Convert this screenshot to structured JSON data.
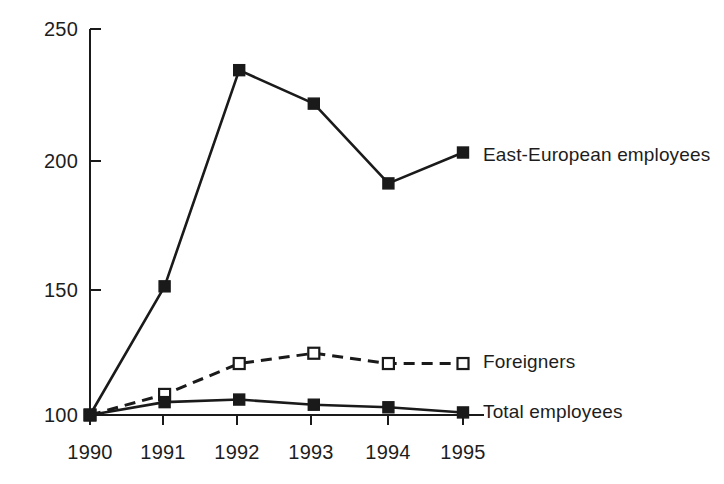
{
  "chart_data": {
    "type": "line",
    "title": "",
    "subtitle": "",
    "xlabel": "",
    "ylabel": "",
    "categories": [
      "1990",
      "1991",
      "1992",
      "1993",
      "1994",
      "1995"
    ],
    "x": [
      1990,
      1991,
      1992,
      1993,
      1994,
      1995
    ],
    "ylim": [
      100,
      250
    ],
    "yticks": [
      "100",
      "150",
      "200",
      "250"
    ],
    "ytick_values": [
      100,
      150,
      200,
      250
    ],
    "grid": false,
    "legend_position": "inline-right-of-series-end",
    "series": [
      {
        "name": "East-European employees",
        "values": [
          100,
          150,
          234,
          221,
          190,
          202
        ],
        "marker": "filled-square",
        "line_style": "solid",
        "color": "#1a1a1a"
      },
      {
        "name": "Foreigners",
        "values": [
          100,
          108,
          120,
          124,
          120,
          120
        ],
        "marker": "open-square",
        "line_style": "dashed",
        "color": "#1a1a1a"
      },
      {
        "name": "Total employees",
        "values": [
          100,
          105,
          106,
          104,
          103,
          101
        ],
        "marker": "filled-square",
        "line_style": "solid",
        "color": "#1a1a1a"
      }
    ],
    "annotations": [
      {
        "text": "East-European employees",
        "at_series": "East-European employees",
        "at_x": "1995"
      },
      {
        "text": "Foreigners",
        "at_series": "Foreigners",
        "at_x": "1995"
      },
      {
        "text": "Total employees",
        "at_series": "Total employees",
        "at_x": "1995"
      }
    ]
  },
  "axis": {
    "y_ticks": [
      {
        "label": "250"
      },
      {
        "label": "200"
      },
      {
        "label": "150"
      },
      {
        "label": "100"
      }
    ],
    "x_ticks": [
      {
        "label": "1990"
      },
      {
        "label": "1991"
      },
      {
        "label": "1992"
      },
      {
        "label": "1993"
      },
      {
        "label": "1994"
      },
      {
        "label": "1995"
      }
    ]
  },
  "labels": {
    "series_1": "East-European employees",
    "series_2": "Foreigners",
    "series_3": "Total employees"
  },
  "colors": {
    "ink": "#1a1a1a",
    "background": "#ffffff"
  }
}
